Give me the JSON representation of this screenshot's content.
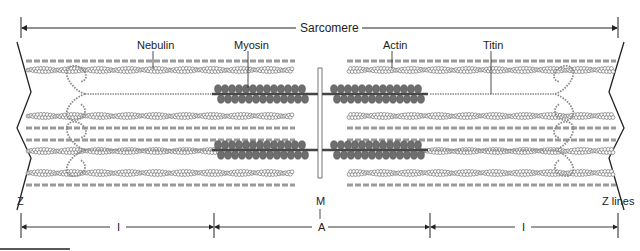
{
  "diagram": {
    "title_label": "Sarcomere",
    "labels": {
      "nebulin": "Nebulin",
      "myosin": "Myosin",
      "actin": "Actin",
      "titin": "Titin",
      "z": "Z",
      "z_lines": "Z lines",
      "m": "M",
      "a": "A",
      "i_left": "I",
      "i_right": "I"
    },
    "colors": {
      "line": "#222222",
      "filament": "#8a8a8a",
      "myosin_head": "#6e6e6e",
      "nebulin": "#9a9a9a"
    }
  }
}
